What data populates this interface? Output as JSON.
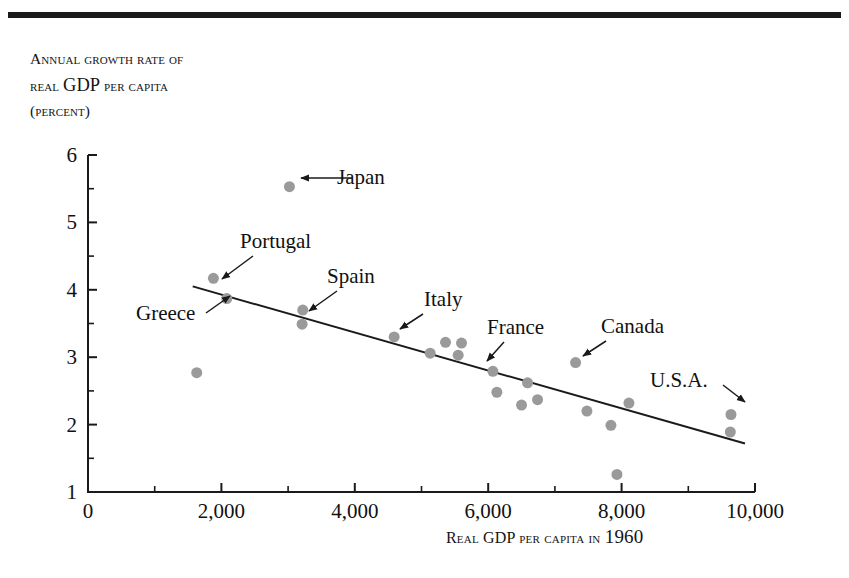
{
  "figure": {
    "y_axis_title_lines": [
      "Annual growth rate of",
      "real GDP per capita",
      "(percent)"
    ],
    "y_axis_title_cap_word": "GDP",
    "x_axis_title_prefix": "Real GDP per capita in ",
    "x_axis_title_year": "1960"
  },
  "chart_data": {
    "type": "scatter",
    "title": "",
    "xlabel": "Real GDP per capita in 1960",
    "ylabel": "Annual growth rate of real GDP per capita (percent)",
    "xlim": [
      0,
      10000
    ],
    "ylim": [
      1,
      6
    ],
    "xticks": [
      0,
      2000,
      4000,
      6000,
      8000,
      10000
    ],
    "xticklabels": [
      "0",
      "2,000",
      "4,000",
      "6,000",
      "8,000",
      "10,000"
    ],
    "xminor_step": 1000,
    "yticks": [
      1,
      2,
      3,
      4,
      5,
      6
    ],
    "yticklabels": [
      "1",
      "2",
      "3",
      "4",
      "5",
      "6"
    ],
    "yminor_step": 0.5,
    "grid": false,
    "legend": "none",
    "marker_color": "#9a9a9a",
    "marker_size_px": 11,
    "line_color": "#1a1a1a",
    "trendline": {
      "x0": 1570,
      "y0": 4.05,
      "x1": 9850,
      "y1": 1.72
    },
    "points": [
      {
        "x": 1630,
        "y": 2.77,
        "label": ""
      },
      {
        "x": 1880,
        "y": 4.17,
        "label": "Portugal"
      },
      {
        "x": 2080,
        "y": 3.87,
        "label": "Greece"
      },
      {
        "x": 3020,
        "y": 5.53,
        "label": "Japan"
      },
      {
        "x": 3220,
        "y": 3.7,
        "label": "Spain"
      },
      {
        "x": 3210,
        "y": 3.49,
        "label": ""
      },
      {
        "x": 4590,
        "y": 3.3,
        "label": "Italy"
      },
      {
        "x": 5130,
        "y": 3.06,
        "label": ""
      },
      {
        "x": 5360,
        "y": 3.22,
        "label": ""
      },
      {
        "x": 5600,
        "y": 3.21,
        "label": ""
      },
      {
        "x": 5550,
        "y": 3.03,
        "label": ""
      },
      {
        "x": 6070,
        "y": 2.79,
        "label": "France"
      },
      {
        "x": 6130,
        "y": 2.48,
        "label": ""
      },
      {
        "x": 6590,
        "y": 2.62,
        "label": ""
      },
      {
        "x": 6500,
        "y": 2.29,
        "label": ""
      },
      {
        "x": 6740,
        "y": 2.37,
        "label": ""
      },
      {
        "x": 7310,
        "y": 2.92,
        "label": "Canada"
      },
      {
        "x": 7480,
        "y": 2.2,
        "label": ""
      },
      {
        "x": 7840,
        "y": 1.99,
        "label": ""
      },
      {
        "x": 7930,
        "y": 1.26,
        "label": ""
      },
      {
        "x": 8110,
        "y": 2.32,
        "label": ""
      },
      {
        "x": 9640,
        "y": 2.15,
        "label": "U.S.A."
      },
      {
        "x": 9630,
        "y": 1.89,
        "label": ""
      }
    ],
    "annotations": [
      {
        "text": "Japan",
        "tx": 337,
        "ty": 184,
        "ax0": 352,
        "ay0": 178,
        "ax1": 301,
        "ay1": 178
      },
      {
        "text": "Portugal",
        "tx": 240,
        "ty": 248,
        "ax0": 253,
        "ay0": 256,
        "ax1": 222,
        "ay1": 279
      },
      {
        "text": "Greece",
        "tx": 136,
        "ty": 320,
        "ax0": 206,
        "ay0": 313,
        "ax1": 230,
        "ay1": 296
      },
      {
        "text": "Spain",
        "tx": 327,
        "ty": 283,
        "ax0": 337,
        "ay0": 291,
        "ax1": 309,
        "ay1": 311
      },
      {
        "text": "Italy",
        "tx": 424,
        "ty": 306,
        "ax0": 423,
        "ay0": 314,
        "ax1": 400,
        "ay1": 329
      },
      {
        "text": "France",
        "tx": 487,
        "ty": 334,
        "ax0": 504,
        "ay0": 342,
        "ax1": 487,
        "ay1": 361
      },
      {
        "text": "Canada",
        "tx": 601,
        "ty": 333,
        "ax0": 606,
        "ay0": 341,
        "ax1": 583,
        "ay1": 356
      },
      {
        "text": "U.S.A.",
        "tx": 650,
        "ty": 387,
        "ax0": 723,
        "ay0": 385,
        "ax1": 745,
        "ay1": 402
      }
    ]
  }
}
